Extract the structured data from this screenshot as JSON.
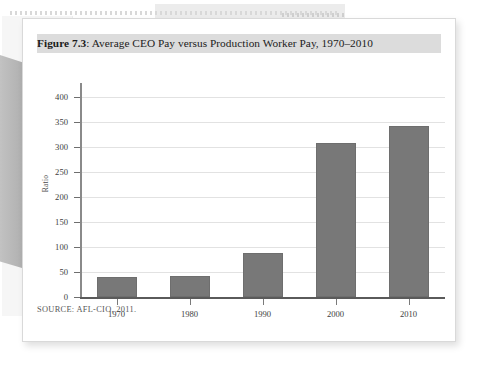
{
  "figure": {
    "label": "Figure 7.3",
    "separator": ":",
    "caption": " Average CEO Pay versus Production Worker Pay, 1970–2010",
    "source": "SOURCE: AFL-CIO, 2011."
  },
  "colors": {
    "bar": "#787878",
    "bar_border": "#6e6e6e",
    "grid": "#e2e2e2",
    "axis": "#5a5a5a",
    "caption_highlight": "#dcdcdc",
    "card": "#ffffff",
    "page_background": "#ffffff"
  },
  "chart_data": {
    "type": "bar",
    "title": "Average CEO Pay versus Production Worker Pay, 1970–2010",
    "categories": [
      "1970",
      "1980",
      "1990",
      "2000",
      "2010"
    ],
    "values": [
      40,
      42,
      88,
      309,
      342
    ],
    "series": [
      {
        "name": "Ratio of average CEO pay to production worker pay",
        "values": [
          40,
          42,
          88,
          309,
          342
        ]
      }
    ],
    "xlabel": "",
    "ylabel": "Ratio",
    "ylim": [
      0,
      400
    ],
    "ytick_values": [
      0,
      50,
      100,
      150,
      200,
      250,
      300,
      350,
      400
    ],
    "ytick_labels": [
      "0",
      "50",
      "100",
      "150",
      "200",
      "250",
      "300",
      "350",
      "400"
    ],
    "grid": true,
    "grid_axis": "y",
    "legend": false,
    "legend_position": "none",
    "source_note": "SOURCE: AFL-CIO, 2011."
  }
}
